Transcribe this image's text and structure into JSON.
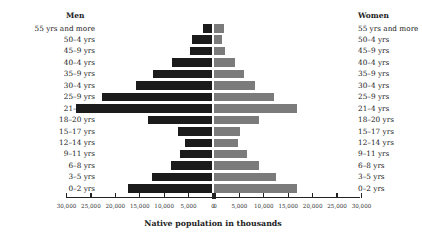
{
  "chart_data": {
    "type": "bar",
    "subtype": "population-pyramid",
    "title": "",
    "xlabel": "Native population in thousands",
    "ylabel": "",
    "left_header": "Men",
    "right_header": "Women",
    "categories": [
      "55 yrs and more",
      "50–4 yrs",
      "45–9 yrs",
      "40–4 yrs",
      "35–9 yrs",
      "30–4 yrs",
      "25–9 yrs",
      "21–4 yrs",
      "18–20 yrs",
      "15–17 yrs",
      "12–14 yrs",
      "9–11 yrs",
      "6–8 yrs",
      "3–5 yrs",
      "0–2 yrs"
    ],
    "series": [
      {
        "name": "Men",
        "color": "#1b1b1b",
        "values": [
          2000,
          4100,
          4700,
          8200,
          12200,
          15700,
          22700,
          28000,
          13300,
          7100,
          5600,
          6600,
          8600,
          12300,
          17300
        ]
      },
      {
        "name": "Women",
        "color": "#7b7b7b",
        "values": [
          2000,
          1700,
          2200,
          4300,
          6100,
          8300,
          12200,
          16900,
          9300,
          5300,
          5000,
          6800,
          9300,
          12700,
          16900
        ]
      }
    ],
    "xlim_left": [
      30000,
      0
    ],
    "xlim_right": [
      0,
      30000
    ],
    "left_ticks": [
      "30,000",
      "25,000",
      "20,000",
      "15,000",
      "10,000",
      "5,000",
      "0"
    ],
    "right_ticks": [
      "0",
      "5,000",
      "10,000",
      "15,000",
      "20,000",
      "25,000",
      "30,000"
    ],
    "grid": false,
    "legend": "none (side headers)"
  }
}
